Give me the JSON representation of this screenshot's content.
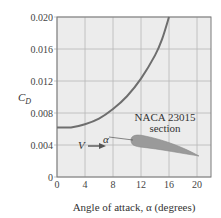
{
  "chart_data": {
    "type": "line",
    "title": "",
    "xlabel": "Angle of attack, α (degrees)",
    "ylabel": "C_D",
    "xlim": [
      0,
      21
    ],
    "ylim": [
      0,
      0.02
    ],
    "x_ticks": [
      "0",
      "4",
      "8",
      "12",
      "16",
      "20"
    ],
    "y_ticks": [
      "0",
      "0.004",
      "0.008",
      "0.012",
      "0.016",
      "0.020"
    ],
    "grid": true,
    "series": [
      {
        "name": "NACA 23015 section",
        "x": [
          0,
          2,
          4,
          6,
          8,
          10,
          12,
          14,
          15,
          16
        ],
        "y": [
          0.0062,
          0.0062,
          0.0066,
          0.0073,
          0.0085,
          0.0101,
          0.0123,
          0.0152,
          0.0172,
          0.02
        ]
      }
    ],
    "annotations": [
      {
        "text": "NACA 23015",
        "sub": "section"
      },
      {
        "text": "V",
        "type": "arrow"
      },
      {
        "text": "α",
        "type": "angle"
      }
    ],
    "colors": {
      "curve": "#6e6e6e",
      "plot_bg": "#ececec",
      "grid": "#b8b8b8",
      "airfoil": "#9a9a9a"
    }
  },
  "labels": {
    "y_axis": "C",
    "y_axis_sub": "D",
    "x_axis": "Angle of attack, α (degrees)",
    "airfoil_name": "NACA 23015",
    "airfoil_sub": "section",
    "velocity": "V",
    "alpha": "α"
  }
}
